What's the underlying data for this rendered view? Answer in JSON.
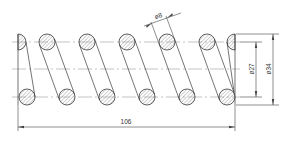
{
  "drawing": {
    "title": "Compression spring section view",
    "colors": {
      "outline": "#3a3a3a",
      "hatch": "#7a7a7a",
      "centerline": "#9a9a9a",
      "dimension": "#444444"
    },
    "dimensions": {
      "length": "106",
      "wire_diameter": "ø8",
      "inner_diameter": "ø27",
      "outer_diameter": "ø34"
    },
    "top_coils_x": [
      47,
      87,
      127,
      167,
      207
    ],
    "bottom_coils_x": [
      27,
      67,
      107,
      147,
      187,
      227
    ],
    "coil_count_label": "6 active coils"
  }
}
